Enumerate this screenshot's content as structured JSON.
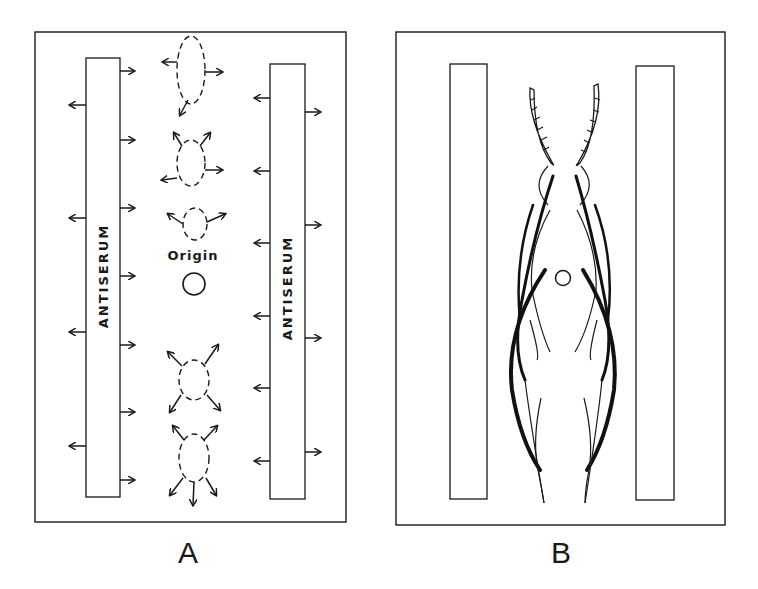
{
  "figure": {
    "panels": [
      {
        "id": "A",
        "label": "A",
        "trough_left_label": "ANTISERUM",
        "trough_right_label": "ANTISERUM",
        "origin_label": "Origin",
        "description": "Schematic of diffusion: antiserum troughs on both sides with arrows showing outward diffusion; dashed antigen zones above and below origin with diffusion arrows"
      },
      {
        "id": "B",
        "label": "B",
        "description": "Resulting precipitin arcs (thick and thin curved lines) between the two troughs around the origin well"
      }
    ]
  }
}
